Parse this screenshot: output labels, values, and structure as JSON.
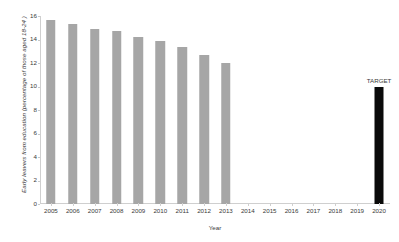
{
  "chart_data": {
    "type": "bar",
    "title": "",
    "xlabel": "Year",
    "ylabel": "Early leavers from education (percentage of those aged 18-24 )",
    "categories": [
      "2005",
      "2006",
      "2007",
      "2008",
      "2009",
      "2010",
      "2011",
      "2012",
      "2013",
      "2014",
      "2015",
      "2016",
      "2017",
      "2018",
      "2019",
      "2020"
    ],
    "series": [
      {
        "name": "Early leavers",
        "color": "#a6a6a6",
        "values": [
          15.7,
          15.3,
          14.9,
          14.7,
          14.2,
          13.9,
          13.4,
          12.7,
          12.0,
          null,
          null,
          null,
          null,
          null,
          null,
          null
        ]
      },
      {
        "name": "Target",
        "color": "#0a0a0a",
        "values": [
          null,
          null,
          null,
          null,
          null,
          null,
          null,
          null,
          null,
          null,
          null,
          null,
          null,
          null,
          null,
          10.0
        ]
      }
    ],
    "annotations": [
      {
        "text": "TARGET",
        "category": "2020",
        "value": 10.0
      }
    ],
    "ylim": [
      0,
      16
    ],
    "ytick_labels": [
      "0",
      "2",
      "4",
      "6",
      "8",
      "10",
      "12",
      "14",
      "16"
    ],
    "ytick_values": [
      0,
      2,
      4,
      6,
      8,
      10,
      12,
      14,
      16
    ],
    "grid": false,
    "legend": "none"
  }
}
